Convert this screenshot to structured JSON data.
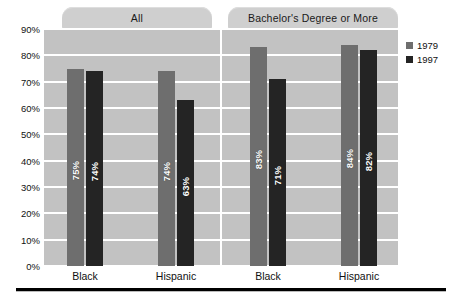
{
  "chart_data": {
    "type": "bar",
    "title": "",
    "xlabel": "",
    "ylabel": "",
    "ylim": [
      0,
      90
    ],
    "grid": true,
    "legend_position": "right",
    "y_ticks": [
      "90%",
      "80%",
      "70%",
      "60%",
      "50%",
      "40%",
      "30%",
      "20%",
      "10%",
      "0%"
    ],
    "y_tick_values": [
      90,
      80,
      70,
      60,
      50,
      40,
      30,
      20,
      10,
      0
    ],
    "series_names": [
      "1979",
      "1997"
    ],
    "series_colors": [
      "#6e6e6e",
      "#242424"
    ],
    "panels": [
      {
        "label": "All",
        "categories": [
          "Black",
          "Hispanic"
        ],
        "series": [
          {
            "name": "1979",
            "values": [
              75,
              74
            ],
            "labels": [
              "75%",
              "74%"
            ]
          },
          {
            "name": "1997",
            "values": [
              74,
              63
            ],
            "labels": [
              "74%",
              "63%"
            ]
          }
        ]
      },
      {
        "label": "Bachelor's Degree or More",
        "categories": [
          "Black",
          "Hispanic"
        ],
        "series": [
          {
            "name": "1979",
            "values": [
              83,
              84
            ],
            "labels": [
              "83%",
              "84%"
            ]
          },
          {
            "name": "1997",
            "values": [
              71,
              82
            ],
            "labels": [
              "71%",
              "82%"
            ]
          }
        ]
      }
    ]
  },
  "panel_tabs": {
    "all": "All",
    "bachelors": "Bachelor's Degree or More"
  },
  "legend": {
    "items": [
      {
        "label": "1979",
        "color": "#6e6e6e"
      },
      {
        "label": "1997",
        "color": "#242424"
      }
    ]
  },
  "y_axis": {
    "ticks": [
      "90%",
      "80%",
      "70%",
      "60%",
      "50%",
      "40%",
      "30%",
      "20%",
      "10%",
      "0%"
    ]
  },
  "x_axis": {
    "labels": [
      "Black",
      "Hispanic",
      "Black",
      "Hispanic"
    ]
  },
  "bars": [
    {
      "label": "75%",
      "value": 75,
      "series": "1979"
    },
    {
      "label": "74%",
      "value": 74,
      "series": "1997"
    },
    {
      "label": "74%",
      "value": 74,
      "series": "1979"
    },
    {
      "label": "63%",
      "value": 63,
      "series": "1997"
    },
    {
      "label": "83%",
      "value": 83,
      "series": "1979"
    },
    {
      "label": "71%",
      "value": 71,
      "series": "1997"
    },
    {
      "label": "84%",
      "value": 84,
      "series": "1979"
    },
    {
      "label": "82%",
      "value": 82,
      "series": "1997"
    }
  ],
  "colors": {
    "plot_background": "#c2c2c2",
    "tab_background": "#cfcfcf",
    "gridline": "#ffffff",
    "series_1979": "#6e6e6e",
    "series_1997": "#242424",
    "rule": "#000000"
  }
}
